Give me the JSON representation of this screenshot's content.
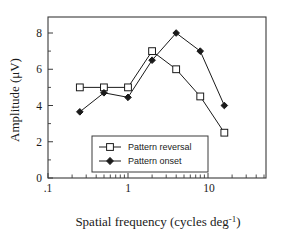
{
  "chart_data": {
    "type": "line",
    "title": "",
    "xlabel": "Spatial frequency (cycles deg-1)",
    "xlabel_base": "Spatial frequency (cycles deg",
    "xlabel_sup": "-1",
    "xlabel_tail": ")",
    "ylabel": "Amplitude (μV)",
    "xscale": "log",
    "yscale": "linear",
    "xlim": [
      0.1,
      32
    ],
    "ylim": [
      0,
      9
    ],
    "grid": false,
    "legend_position": "lower-center",
    "xticks": [
      0.1,
      1,
      10
    ],
    "xtick_labels": [
      ".1",
      "1",
      "10"
    ],
    "yticks": [
      0,
      2,
      4,
      6,
      8
    ],
    "ytick_labels": [
      "0",
      "2",
      "4",
      "6",
      "8"
    ],
    "x": [
      0.25,
      0.5,
      1,
      2,
      4,
      8,
      16
    ],
    "series": [
      {
        "name": "Pattern reversal",
        "marker": "open-square",
        "color": "#1a1a1a",
        "values": [
          5.0,
          5.0,
          5.0,
          7.0,
          6.0,
          4.5,
          2.5
        ]
      },
      {
        "name": "Pattern onset",
        "marker": "filled-diamond",
        "color": "#1a1a1a",
        "values": [
          3.65,
          4.7,
          4.45,
          6.5,
          8.0,
          7.0,
          4.0
        ]
      }
    ]
  },
  "legend": {
    "entries": [
      {
        "label": "Pattern reversal"
      },
      {
        "label": "Pattern onset"
      }
    ]
  },
  "axes": {
    "y_axis_title": "Amplitude (μV)",
    "x_axis_title": "Spatial frequency (cycles deg-1)"
  }
}
